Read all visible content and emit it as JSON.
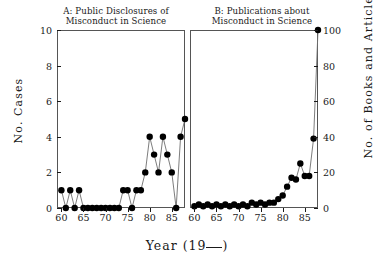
{
  "figure": {
    "xlabel_prefix": "Year (19",
    "xlabel_suffix": ")"
  },
  "panelA": {
    "title_line1": "A: Public Disclosures of",
    "title_line2": "Misconduct in Science",
    "ylabel": "No. Cases",
    "yticks": [
      "0",
      "2",
      "4",
      "6",
      "8",
      "10"
    ],
    "xticks": [
      "60",
      "65",
      "70",
      "75",
      "80",
      "85"
    ]
  },
  "panelB": {
    "title_line1": "B: Publications about",
    "title_line2": "Misconduct in Science",
    "ylabel": "No. of Books and Articles",
    "yticks": [
      "0",
      "20",
      "40",
      "60",
      "80",
      "100"
    ],
    "xticks": [
      "60",
      "65",
      "70",
      "75",
      "80",
      "85"
    ]
  },
  "chart_data": [
    {
      "type": "line",
      "panel": "A",
      "title": "A: Public Disclosures of Misconduct in Science",
      "xlabel": "Year (19__)",
      "ylabel": "No. Cases",
      "xlim": [
        59,
        88
      ],
      "ylim": [
        0,
        10
      ],
      "yticks": [
        0,
        2,
        4,
        6,
        8,
        10
      ],
      "xticks": [
        60,
        65,
        70,
        75,
        80,
        85
      ],
      "grid": false,
      "legend": "none",
      "marker": "filled-circle",
      "x": [
        60,
        61,
        62,
        63,
        64,
        65,
        66,
        67,
        68,
        69,
        70,
        71,
        72,
        73,
        74,
        75,
        76,
        77,
        78,
        79,
        80,
        81,
        82,
        83,
        84,
        85,
        86,
        87
      ],
      "values": [
        1,
        0,
        1,
        0,
        1,
        0,
        0,
        0,
        0,
        0,
        0,
        0,
        0,
        0,
        1,
        1,
        0,
        1,
        1,
        2,
        4,
        3,
        2,
        4,
        3,
        2,
        0,
        4,
        5
      ]
    },
    {
      "type": "line",
      "panel": "B",
      "title": "B: Publications about Misconduct in Science",
      "xlabel": "Year (19__)",
      "ylabel": "No. of Books and Articles",
      "xlim": [
        59,
        88
      ],
      "ylim": [
        0,
        100
      ],
      "yticks": [
        0,
        20,
        40,
        60,
        80,
        100
      ],
      "xticks": [
        60,
        65,
        70,
        75,
        80,
        85
      ],
      "grid": false,
      "legend": "none",
      "marker": "filled-circle",
      "x": [
        60,
        61,
        62,
        63,
        64,
        65,
        66,
        67,
        68,
        69,
        70,
        71,
        72,
        73,
        74,
        75,
        76,
        77,
        78,
        79,
        80,
        81,
        82,
        83,
        84,
        85,
        86,
        87
      ],
      "values": [
        1,
        2,
        1,
        2,
        1,
        2,
        1,
        2,
        1,
        2,
        1,
        2,
        1,
        3,
        2,
        3,
        2,
        3,
        3,
        5,
        7,
        12,
        17,
        16,
        25,
        18,
        18,
        39,
        100
      ]
    }
  ]
}
